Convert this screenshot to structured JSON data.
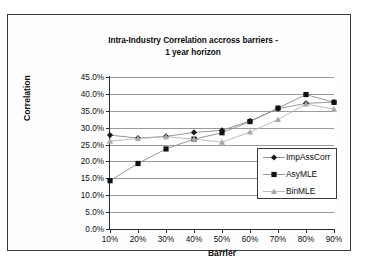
{
  "chart_data": {
    "type": "line",
    "title": "Intra-Industry Correlation accross barriers - 1 year horizon",
    "title_line1": "Intra-Industry Correlation accross barriers -",
    "title_line2": "1 year horizon",
    "xlabel": "Barrier",
    "ylabel": "Correlation",
    "categories": [
      "10%",
      "20%",
      "30%",
      "40%",
      "50%",
      "60%",
      "70%",
      "80%",
      "90%"
    ],
    "x_values": [
      10,
      20,
      30,
      40,
      50,
      60,
      70,
      80,
      90
    ],
    "ytick_labels": [
      "0.0%",
      "5.0%",
      "10.0%",
      "15.0%",
      "20.0%",
      "25.0%",
      "30.0%",
      "35.0%",
      "40.0%",
      "45.0%"
    ],
    "ytick_values": [
      0,
      5,
      10,
      15,
      20,
      25,
      30,
      35,
      40,
      45
    ],
    "ylim": [
      0,
      45
    ],
    "grid": true,
    "legend_position": "inside-right-lower",
    "series": [
      {
        "name": "ImpAssCorr",
        "marker": "diamond",
        "color": "#1a1a1a",
        "line_color": "#8c8c8c",
        "values": [
          27.8,
          26.9,
          27.4,
          28.6,
          29.2,
          32.0,
          35.6,
          37.2,
          37.6
        ]
      },
      {
        "name": "AsyMLE",
        "marker": "square",
        "color": "#111111",
        "line_color": "#8c8c8c",
        "values": [
          14.3,
          19.4,
          23.7,
          26.6,
          28.5,
          31.8,
          35.8,
          39.8,
          37.5
        ]
      },
      {
        "name": "BinMLE",
        "marker": "triangle",
        "color": "#a9a9a9",
        "line_color": "#b4b4b4",
        "values": [
          26.0,
          26.8,
          27.3,
          26.6,
          25.7,
          28.7,
          32.4,
          37.0,
          35.5
        ]
      }
    ]
  }
}
